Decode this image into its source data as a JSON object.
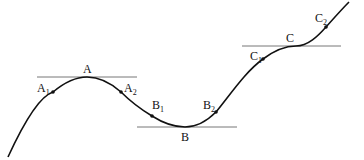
{
  "diagram": {
    "colors": {
      "curve": "#111111",
      "tangent": "#777777",
      "text": "#111111"
    },
    "points": {
      "A": {
        "letter": "A",
        "sub": ""
      },
      "A1": {
        "letter": "A",
        "sub": "1"
      },
      "A2": {
        "letter": "A",
        "sub": "2"
      },
      "B": {
        "letter": "B",
        "sub": ""
      },
      "B1": {
        "letter": "B",
        "sub": "1"
      },
      "B2": {
        "letter": "B",
        "sub": "2"
      },
      "C": {
        "letter": "C",
        "sub": ""
      },
      "C1": {
        "letter": "C",
        "sub": "1"
      },
      "C2": {
        "letter": "C",
        "sub": "2"
      }
    },
    "tangent_lines": [
      {
        "name": "tangent-at-A",
        "point": "A"
      },
      {
        "name": "tangent-at-B",
        "point": "B"
      },
      {
        "name": "tangent-at-C",
        "point": "C"
      }
    ]
  }
}
